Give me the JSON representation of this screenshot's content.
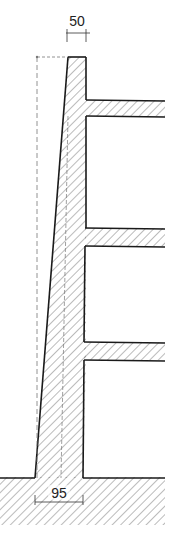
{
  "diagram": {
    "type": "structural-section",
    "dimensions": {
      "top_width_label": "50",
      "base_width_label": "95"
    },
    "elements": {
      "wall": "tapered-wall",
      "slabs": [
        "slab-1",
        "slab-2",
        "slab-3"
      ],
      "ground": "foundation-ground"
    },
    "colors": {
      "line": "#1a1a1a",
      "hatch": "#555555",
      "dashed": "#777777",
      "background": "#ffffff"
    }
  }
}
